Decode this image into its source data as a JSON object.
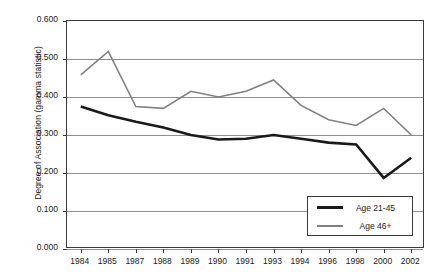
{
  "chart_data": {
    "type": "line",
    "title": "",
    "xlabel": "",
    "ylabel": "Degree of Association (gamma statistic)",
    "categories": [
      "1984",
      "1985",
      "1987",
      "1988",
      "1989",
      "1990",
      "1991",
      "1993",
      "1994",
      "1996",
      "1998",
      "2000",
      "2002"
    ],
    "ylim": [
      0.0,
      0.6
    ],
    "ytick_labels": [
      "0.600",
      "0.500",
      "0.400",
      "0.300",
      "0.200",
      "0.100",
      "0.000"
    ],
    "ytick_values": [
      0.6,
      0.5,
      0.4,
      0.3,
      0.2,
      0.1,
      0.0
    ],
    "grid": true,
    "legend_position": "bottom-right",
    "series": [
      {
        "name": "Age 21-45",
        "color": "#1a1a1a",
        "width": 2.6,
        "values": [
          0.375,
          0.352,
          0.335,
          0.32,
          0.3,
          0.288,
          0.29,
          0.3,
          0.29,
          0.28,
          0.275,
          0.187,
          0.24
        ]
      },
      {
        "name": "Age 46+",
        "color": "#808080",
        "width": 1.6,
        "values": [
          0.458,
          0.52,
          0.375,
          0.37,
          0.415,
          0.4,
          0.415,
          0.445,
          0.378,
          0.34,
          0.325,
          0.37,
          0.3
        ]
      }
    ]
  },
  "legend": {
    "items": [
      {
        "label": "Age 21-45"
      },
      {
        "label": "Age 46+"
      }
    ]
  }
}
